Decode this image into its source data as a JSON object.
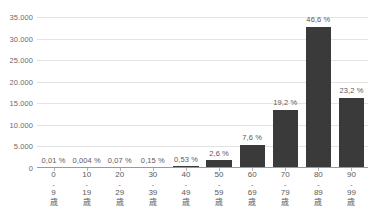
{
  "chart_data": {
    "type": "bar",
    "title": "",
    "subtitle": "",
    "xlabel": "",
    "ylabel": "",
    "categories": [
      "0 - 9 歳",
      "10 - 19 歳",
      "20 - 29 歳",
      "30 - 39 歳",
      "40 - 49 歳",
      "50 - 59 歳",
      "60 - 69 歳",
      "70 - 79 歳",
      "80 - 89 歳",
      "90 - 99 歳"
    ],
    "category_parts": [
      {
        "start": "0",
        "dash": "-",
        "end": "9",
        "unit": "歳"
      },
      {
        "start": "10",
        "dash": "-",
        "end": "19",
        "unit": "歳"
      },
      {
        "start": "20",
        "dash": "-",
        "end": "29",
        "unit": "歳"
      },
      {
        "start": "30",
        "dash": "-",
        "end": "39",
        "unit": "歳"
      },
      {
        "start": "40",
        "dash": "-",
        "end": "49",
        "unit": "歳"
      },
      {
        "start": "50",
        "dash": "-",
        "end": "59",
        "unit": "歳"
      },
      {
        "start": "60",
        "dash": "-",
        "end": "69",
        "unit": "歳"
      },
      {
        "start": "70",
        "dash": "-",
        "end": "79",
        "unit": "歳"
      },
      {
        "start": "80",
        "dash": "-",
        "end": "89",
        "unit": "歳"
      },
      {
        "start": "90",
        "dash": "-",
        "end": "99",
        "unit": "歳"
      }
    ],
    "values": [
      5,
      2,
      50,
      105,
      370,
      1830,
      5350,
      13500,
      32800,
      16300
    ],
    "data_labels": [
      "0,01 %",
      "0,004 %",
      "0,07 %",
      "0,15 %",
      "0,53 %",
      "2,6 %",
      "7,6 %",
      "19,2 %",
      "46,6 %",
      "23,2 %"
    ],
    "percent_values": [
      0.01,
      0.004,
      0.07,
      0.15,
      0.53,
      2.6,
      7.6,
      19.2,
      46.6,
      23.2
    ],
    "ylim": [
      0,
      35000
    ],
    "ytick_step": 5000,
    "ytick_labels": [
      "0",
      "5.000",
      "10.000",
      "15.000",
      "20.000",
      "25.000",
      "30.000",
      "35.000"
    ],
    "ytick_values": [
      0,
      5000,
      10000,
      15000,
      20000,
      25000,
      30000,
      35000
    ],
    "grid": true,
    "legend": false,
    "colors": {
      "bar": "#3a3a3a",
      "gridline": "#e3e3e3",
      "axis": "#9a9a9a",
      "text": "#5a5a5a",
      "tick_text": "#6b6b6b",
      "background": "#ffffff"
    }
  }
}
